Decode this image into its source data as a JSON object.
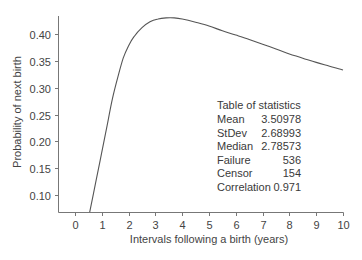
{
  "chart_data": {
    "type": "line",
    "title": "",
    "xlabel": "Intervals following a birth (years)",
    "ylabel": "Probability of next birth",
    "xlim": [
      -0.65,
      10
    ],
    "ylim": [
      0.068,
      0.44
    ],
    "x_ticks": [
      0,
      1,
      2,
      3,
      4,
      5,
      6,
      7,
      8,
      9,
      10
    ],
    "x_tick_labels": [
      "0",
      "1",
      "2",
      "3",
      "4",
      "5",
      "6",
      "7",
      "8",
      "9",
      "10"
    ],
    "y_ticks": [
      0.1,
      0.15,
      0.2,
      0.25,
      0.3,
      0.35,
      0.4
    ],
    "y_tick_labels": [
      "0.10",
      "0.15",
      "0.20",
      "0.25",
      "0.30",
      "0.35",
      "0.40"
    ],
    "grid": false,
    "legend": null,
    "series": [
      {
        "name": "Probability of next birth",
        "x": [
          0.55,
          0.8,
          1.0,
          1.2,
          1.4,
          1.6,
          1.8,
          2.0,
          2.2,
          2.5,
          2.8,
          3.1,
          3.4,
          3.7,
          4.0,
          4.5,
          5.0,
          5.5,
          6.0,
          6.5,
          7.0,
          7.5,
          8.0,
          8.5,
          9.0,
          9.5,
          10.0
        ],
        "y": [
          0.068,
          0.13,
          0.18,
          0.23,
          0.28,
          0.32,
          0.355,
          0.378,
          0.395,
          0.412,
          0.423,
          0.428,
          0.43,
          0.43,
          0.428,
          0.422,
          0.415,
          0.406,
          0.398,
          0.39,
          0.381,
          0.372,
          0.363,
          0.355,
          0.347,
          0.34,
          0.333
        ]
      }
    ],
    "annotations": [
      {
        "type": "table",
        "title": "Table of statistics",
        "rows": [
          {
            "label": "Mean",
            "value": "3.50978"
          },
          {
            "label": "StDev",
            "value": "2.68993"
          },
          {
            "label": "Median",
            "value": "2.78573"
          },
          {
            "label": "Failure",
            "value": "536"
          },
          {
            "label": "Censor",
            "value": "154"
          },
          {
            "label": "Correlation",
            "value": "0.971"
          }
        ]
      }
    ]
  },
  "colors": {
    "line": "#555555",
    "axis": "#777777",
    "text": "#444444"
  },
  "stats_table": {
    "title": "Table of statistics",
    "rows": [
      {
        "label": "Mean",
        "value": "3.50978"
      },
      {
        "label": "StDev",
        "value": "2.68993"
      },
      {
        "label": "Median",
        "value": "2.78573"
      },
      {
        "label": "Failure",
        "value": "536"
      },
      {
        "label": "Censor",
        "value": "154"
      },
      {
        "label": "Correlation",
        "value": "0.971"
      }
    ]
  }
}
